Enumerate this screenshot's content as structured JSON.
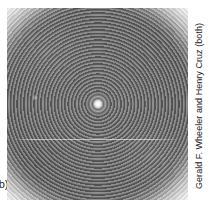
{
  "figure": {
    "label": "(b)",
    "caption_credit": "Gerald F. Wheeler and Henry Cruz (both)"
  },
  "photo": {
    "alt_name": "circular-interference-pattern",
    "description": "Concentric circular interference fringes with bright central maximum on a dark disc with white vignetted corners",
    "center_x_pct": 49.5,
    "center_y_pct": 50,
    "background_color": "#ffffff",
    "disc_color": "#6b6b6b",
    "vignette_color": "#f7f7f7",
    "core_color": "#ffffff"
  },
  "colors": {
    "page_background": "#ffffff",
    "text": "#1a1a1a",
    "photo_dark": "#676767",
    "photo_light": "#f7f7f7"
  }
}
